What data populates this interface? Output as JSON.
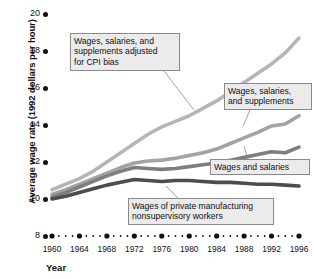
{
  "chart_data": {
    "type": "line",
    "title": "",
    "xlabel": "Year",
    "ylabel": "Average wage rate (1992 dollars per hour)",
    "xlim": [
      1959,
      1997
    ],
    "ylim": [
      8,
      20
    ],
    "yticks": [
      8,
      10,
      12,
      14,
      16,
      18,
      20
    ],
    "xticks": [
      1960,
      1964,
      1968,
      1972,
      1976,
      1980,
      1984,
      1988,
      1992,
      1996
    ],
    "grid": false,
    "legend": "callouts",
    "x": [
      1960,
      1962,
      1964,
      1966,
      1968,
      1970,
      1972,
      1974,
      1976,
      1978,
      1980,
      1982,
      1984,
      1986,
      1988,
      1990,
      1992,
      1994,
      1996
    ],
    "series": [
      {
        "name": "Wages, salaries, and supplements adjusted for CPI bias",
        "color": "#b5b5b5",
        "values": [
          10.5,
          10.8,
          11.1,
          11.5,
          12.0,
          12.5,
          13.0,
          13.5,
          13.9,
          14.2,
          14.5,
          14.9,
          15.3,
          15.8,
          16.3,
          16.8,
          17.3,
          17.9,
          18.7
        ]
      },
      {
        "name": "Wages, salaries, and supplements",
        "color": "#a3a3a3",
        "values": [
          10.25,
          10.5,
          10.8,
          11.1,
          11.4,
          11.7,
          11.95,
          12.05,
          12.1,
          12.2,
          12.35,
          12.5,
          12.7,
          13.0,
          13.3,
          13.6,
          13.95,
          14.05,
          14.5
        ]
      },
      {
        "name": "Wages and salaries",
        "color": "#7e7e7e",
        "values": [
          10.1,
          10.35,
          10.65,
          10.95,
          11.25,
          11.5,
          11.7,
          11.65,
          11.6,
          11.65,
          11.75,
          11.85,
          11.95,
          12.1,
          12.25,
          12.4,
          12.55,
          12.5,
          12.8
        ]
      },
      {
        "name": "Wages of private manufacturing nonsupervisory workers",
        "color": "#4d4d4d",
        "values": [
          10.0,
          10.15,
          10.35,
          10.55,
          10.75,
          10.9,
          11.05,
          11.0,
          10.95,
          11.0,
          11.0,
          10.95,
          10.9,
          10.9,
          10.85,
          10.8,
          10.8,
          10.75,
          10.7
        ]
      }
    ],
    "annotations": [
      {
        "id": "callout-cpi-adjusted",
        "text": "Wages, salaries, and\nsupplements adjusted\nfor CPI bias",
        "box": {
          "x": 70,
          "y": 33,
          "w": 110,
          "h": 38
        },
        "leader": {
          "x1": 164,
          "y1": 71,
          "x2": 194,
          "y2": 110
        }
      },
      {
        "id": "callout-wages-salaries-supplements",
        "text": "Wages, salaries,\nand supplements",
        "box": {
          "x": 224,
          "y": 83,
          "w": 88,
          "h": 27
        },
        "leader": {
          "x1": 250,
          "y1": 110,
          "x2": 243,
          "y2": 126
        }
      },
      {
        "id": "callout-wages-and-salaries",
        "text": "Wages and salaries",
        "box": {
          "x": 210,
          "y": 159,
          "w": 100,
          "h": 16
        },
        "leader": {
          "x1": 248,
          "y1": 159,
          "x2": 244,
          "y2": 146
        }
      },
      {
        "id": "callout-manufacturing-nonsupervisory",
        "text": "Wages of private manufacturing\nnonsupervisory workers",
        "box": {
          "x": 128,
          "y": 198,
          "w": 146,
          "h": 27
        },
        "leader": {
          "x1": 178,
          "y1": 198,
          "x2": 166,
          "y2": 186
        }
      }
    ]
  },
  "axis": {
    "y_title": "Average wage rate (1992 dollars per hour)",
    "x_title": "Year",
    "y_tick_labels": [
      "20",
      "18",
      "16",
      "14",
      "12",
      "10",
      "8"
    ],
    "x_tick_labels": [
      "1960",
      "1964",
      "1968",
      "1972",
      "1976",
      "1980",
      "1984",
      "1988",
      "1992",
      "1996"
    ]
  }
}
